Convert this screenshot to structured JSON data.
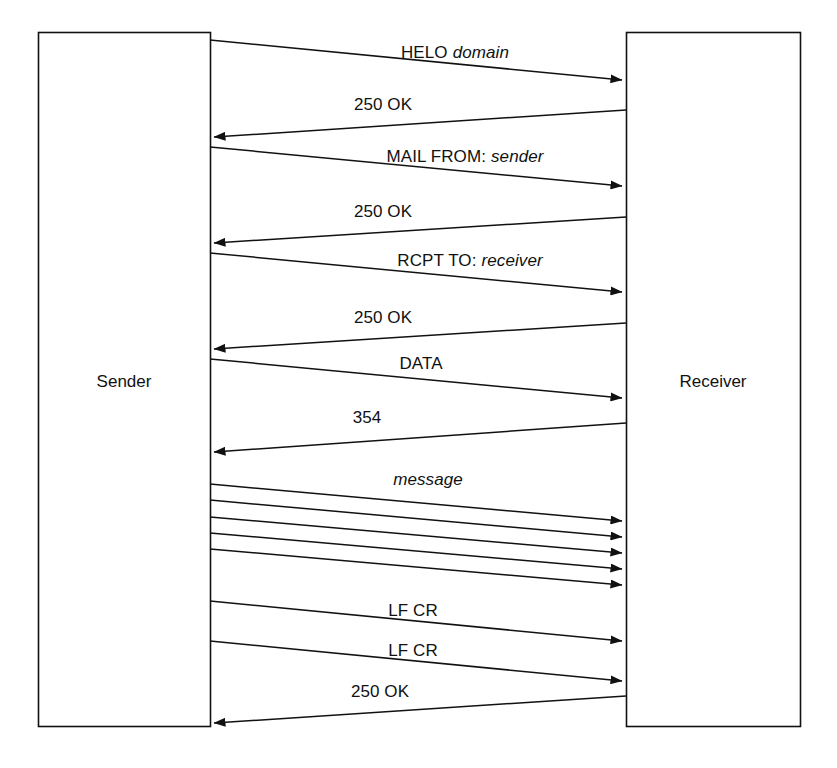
{
  "diagram": {
    "type": "sequence-diagram",
    "background_color": "#ffffff",
    "stroke_color": "#111111",
    "actors": [
      {
        "id": "sender",
        "label": "Sender",
        "side": "left",
        "box": {
          "x": 38,
          "y": 32,
          "w": 172,
          "h": 694
        },
        "label_x": 124,
        "label_y": 382
      },
      {
        "id": "receiver",
        "label": "Receiver",
        "side": "right",
        "box": {
          "x": 626,
          "y": 32,
          "w": 174,
          "h": 694
        },
        "label_x": 713,
        "label_y": 382
      }
    ],
    "messages": [
      {
        "index": 1,
        "direction": "request",
        "label_plain": "HELO",
        "label_italic": "domain",
        "label_x": 455,
        "label_y": 60,
        "from_x": 210,
        "from_y": 40,
        "to_x": 622,
        "to_y": 80
      },
      {
        "index": 2,
        "direction": "response",
        "label_plain": "250 OK",
        "label_italic": "",
        "label_x": 383,
        "label_y": 112,
        "from_x": 626,
        "from_y": 110,
        "to_x": 214,
        "to_y": 137
      },
      {
        "index": 3,
        "direction": "request",
        "label_plain": "MAIL FROM:",
        "label_italic": "sender",
        "label_x": 465,
        "label_y": 164,
        "from_x": 210,
        "from_y": 147,
        "to_x": 622,
        "to_y": 186
      },
      {
        "index": 4,
        "direction": "response",
        "label_plain": "250 OK",
        "label_italic": "",
        "label_x": 383,
        "label_y": 219,
        "from_x": 626,
        "from_y": 217,
        "to_x": 214,
        "to_y": 243
      },
      {
        "index": 5,
        "direction": "request",
        "label_plain": "RCPT TO:",
        "label_italic": "receiver",
        "label_x": 470,
        "label_y": 268,
        "from_x": 210,
        "from_y": 253,
        "to_x": 622,
        "to_y": 292
      },
      {
        "index": 6,
        "direction": "response",
        "label_plain": "250 OK",
        "label_italic": "",
        "label_x": 383,
        "label_y": 325,
        "from_x": 626,
        "from_y": 323,
        "to_x": 214,
        "to_y": 349
      },
      {
        "index": 7,
        "direction": "request",
        "label_plain": "DATA",
        "label_italic": "",
        "label_x": 421,
        "label_y": 371,
        "from_x": 210,
        "from_y": 359,
        "to_x": 622,
        "to_y": 398
      },
      {
        "index": 8,
        "direction": "response",
        "label_plain": "354",
        "label_italic": "",
        "label_x": 367,
        "label_y": 425,
        "from_x": 626,
        "from_y": 423,
        "to_x": 214,
        "to_y": 452
      },
      {
        "index": 9,
        "direction": "request-multi",
        "label_plain": "",
        "label_italic": "message",
        "label_x": 428,
        "label_y": 487,
        "lines": [
          {
            "from_x": 210,
            "from_y": 484,
            "to_x": 622,
            "to_y": 521
          },
          {
            "from_x": 210,
            "from_y": 500,
            "to_x": 622,
            "to_y": 537
          },
          {
            "from_x": 210,
            "from_y": 517,
            "to_x": 622,
            "to_y": 553
          },
          {
            "from_x": 210,
            "from_y": 533,
            "to_x": 622,
            "to_y": 569
          },
          {
            "from_x": 210,
            "from_y": 549,
            "to_x": 622,
            "to_y": 585
          }
        ]
      },
      {
        "index": 10,
        "direction": "request",
        "label_plain": "LF CR",
        "label_italic": "",
        "label_x": 413,
        "label_y": 618,
        "from_x": 210,
        "from_y": 601,
        "to_x": 622,
        "to_y": 641
      },
      {
        "index": 11,
        "direction": "request",
        "label_plain": "LF CR",
        "label_italic": "",
        "label_x": 413,
        "label_y": 658,
        "from_x": 210,
        "from_y": 641,
        "to_x": 622,
        "to_y": 681
      },
      {
        "index": 12,
        "direction": "response",
        "label_plain": "250 OK",
        "label_italic": "",
        "label_x": 380,
        "label_y": 699,
        "from_x": 626,
        "from_y": 696,
        "to_x": 214,
        "to_y": 723
      }
    ]
  }
}
